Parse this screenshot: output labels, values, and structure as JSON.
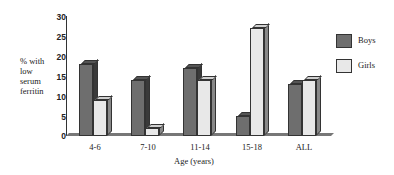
{
  "chart_data": {
    "type": "bar",
    "title": "",
    "xlabel": "Age (years)",
    "ylabel": "% with low serum ferritin",
    "ylim": [
      0,
      30
    ],
    "yticks": [
      0,
      5,
      10,
      15,
      20,
      25,
      30
    ],
    "categories": [
      "4-6",
      "7-10",
      "11-14",
      "15-18",
      "ALL"
    ],
    "series": [
      {
        "name": "Boys",
        "color": "#6e6e6e",
        "values": [
          18,
          14,
          17,
          5,
          13
        ]
      },
      {
        "name": "Girls",
        "color": "#e8e8e8",
        "values": [
          9,
          2,
          14,
          27,
          14
        ]
      }
    ],
    "legend_position": "right",
    "grid": false,
    "style": "3d-bar"
  },
  "labels": {
    "ylabel_lines": [
      "% with",
      "low",
      "serum",
      "ferritin"
    ],
    "xlabel": "Age (years)",
    "yticks": [
      "30",
      "25",
      "20",
      "15",
      "10",
      "5",
      "0"
    ],
    "categories": [
      "4-6",
      "7-10",
      "11-14",
      "15-18",
      "ALL"
    ],
    "legend": [
      "Boys",
      "Girls"
    ]
  }
}
